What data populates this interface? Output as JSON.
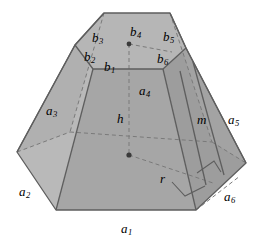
{
  "figure": {
    "background_color": "#ffffff",
    "outline_color": "#6e6e6e",
    "dashed_color": "#7d7d7d",
    "fill_front": "#a8a8a8",
    "fill_side_left": "#b4b4b4",
    "fill_side_right": "#9e9e9e",
    "fill_top": "#b8b8b8",
    "dot_color": "#3a3a3a"
  },
  "labels": {
    "a1": {
      "base": "a",
      "sub": "1",
      "x": 121,
      "y": 222
    },
    "a2": {
      "base": "a",
      "sub": "2",
      "x": 19,
      "y": 185
    },
    "a3": {
      "base": "a",
      "sub": "3",
      "x": 46,
      "y": 104
    },
    "a4": {
      "base": "a",
      "sub": "4",
      "x": 139,
      "y": 84
    },
    "a5": {
      "base": "a",
      "sub": "5",
      "x": 228,
      "y": 113
    },
    "a6": {
      "base": "a",
      "sub": "6",
      "x": 224,
      "y": 190
    },
    "b1": {
      "base": "b",
      "sub": "1",
      "x": 104,
      "y": 60
    },
    "b2": {
      "base": "b",
      "sub": "2",
      "x": 84,
      "y": 50
    },
    "b3": {
      "base": "b",
      "sub": "3",
      "x": 92,
      "y": 31
    },
    "b4": {
      "base": "b",
      "sub": "4",
      "x": 130,
      "y": 25
    },
    "b5": {
      "base": "b",
      "sub": "5",
      "x": 163,
      "y": 30
    },
    "b6": {
      "base": "b",
      "sub": "6",
      "x": 157,
      "y": 52
    },
    "h": {
      "base": "h",
      "sub": "",
      "x": 117,
      "y": 112
    },
    "m": {
      "base": "m",
      "sub": "",
      "x": 197,
      "y": 113
    },
    "r": {
      "base": "r",
      "sub": "",
      "x": 160,
      "y": 172
    }
  },
  "geometry": {
    "bottom_hex": {
      "front_left": [
        56,
        210
      ],
      "front_right": [
        196,
        210
      ],
      "right": [
        246,
        163
      ],
      "left": [
        17,
        152
      ],
      "back_right_hidden": [
        212,
        142
      ],
      "back_left_hidden": [
        70,
        132
      ]
    },
    "top_hex": {
      "front_left": [
        93,
        69
      ],
      "front_right": [
        163,
        69
      ],
      "right": [
        186,
        48
      ],
      "left": [
        75,
        45
      ],
      "back_right": [
        170,
        13
      ],
      "back_left": [
        104,
        13
      ]
    },
    "centers": {
      "top_center": [
        129,
        44
      ],
      "bottom_center": [
        129,
        155
      ]
    }
  }
}
